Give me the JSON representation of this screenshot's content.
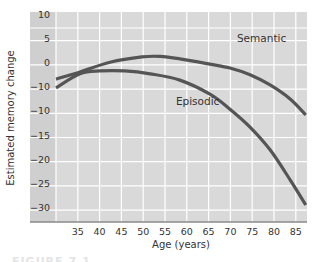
{
  "chart_data": {
    "type": "line",
    "title": "",
    "xlabel": "Age (years)",
    "ylabel": "Estimated memory change",
    "xlim": [
      30,
      87.5
    ],
    "ylim": [
      -32,
      12
    ],
    "grid": true,
    "legend": "inline labels",
    "x_ticks": [
      35,
      40,
      45,
      50,
      55,
      60,
      65,
      70,
      75,
      80,
      85
    ],
    "y_tick_labels": [
      "10",
      "5",
      "0",
      "−10",
      "−10",
      "−15",
      "−20",
      "−25",
      "−30"
    ],
    "y_tick_values": [
      10,
      5,
      0,
      -5,
      -10,
      -15,
      -20,
      -25,
      -30
    ],
    "series": [
      {
        "name": "Semantic",
        "color": "#555555",
        "points": [
          [
            30,
            -2.1
          ],
          [
            35.5,
            -0.6
          ],
          [
            42.4,
            1.4
          ],
          [
            49.7,
            2.5
          ],
          [
            53.9,
            2.6
          ],
          [
            58.4,
            2.1
          ],
          [
            65.3,
            1.0
          ],
          [
            69.9,
            0.2
          ],
          [
            74.5,
            -1.2
          ],
          [
            79.1,
            -3.3
          ],
          [
            83.7,
            -6.2
          ],
          [
            87.3,
            -9.5
          ]
        ],
        "label_pos": [
          71.5,
          5.6
        ]
      },
      {
        "name": "Episodic",
        "color": "#555555",
        "points": [
          [
            30,
            -3.9
          ],
          [
            35.5,
            -1.0
          ],
          [
            40.1,
            -0.4
          ],
          [
            45.8,
            -0.4
          ],
          [
            51.6,
            -1.0
          ],
          [
            58.4,
            -2.3
          ],
          [
            65.3,
            -5.2
          ],
          [
            69.9,
            -8.3
          ],
          [
            74.5,
            -12.0
          ],
          [
            79.1,
            -16.7
          ],
          [
            83.7,
            -22.9
          ],
          [
            87.3,
            -28.1
          ]
        ],
        "label_pos": [
          57.5,
          -7.5
        ]
      }
    ],
    "colors": {
      "plot_bg": "#d9d9d9",
      "label_band_bg": "#cfcfcf",
      "grid": "#ffffff",
      "axis": "#8a8a8a",
      "line": "#555555"
    }
  },
  "caption_fragment": "FIGURE 7.1"
}
